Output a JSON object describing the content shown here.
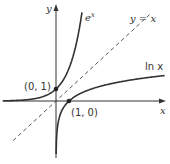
{
  "chart_data": {
    "type": "line",
    "title": "",
    "xlabel": "x",
    "ylabel": "y",
    "series": [
      {
        "name": "e^x",
        "function": "exp(x)",
        "style": "solid"
      },
      {
        "name": "ln x",
        "function": "log(x)",
        "style": "solid"
      },
      {
        "name": "y = x",
        "function": "x",
        "style": "dashed"
      }
    ],
    "points": [
      {
        "label": "(0, 1)",
        "x": 0,
        "y": 1
      },
      {
        "label": "(1, 0)",
        "x": 1,
        "y": 0
      }
    ],
    "xlim": [
      -4.3,
      8.5
    ],
    "ylim": [
      -5,
      8
    ],
    "grid": false,
    "legend": "none"
  },
  "labels": {
    "y_axis": "y",
    "x_axis": "x",
    "exp_curve_base": "e",
    "exp_curve_exp": "x",
    "identity_line": "y = x",
    "ln_curve": "ln x",
    "point_0_1": "(0, 1)",
    "point_1_0": "(1, 0)"
  }
}
